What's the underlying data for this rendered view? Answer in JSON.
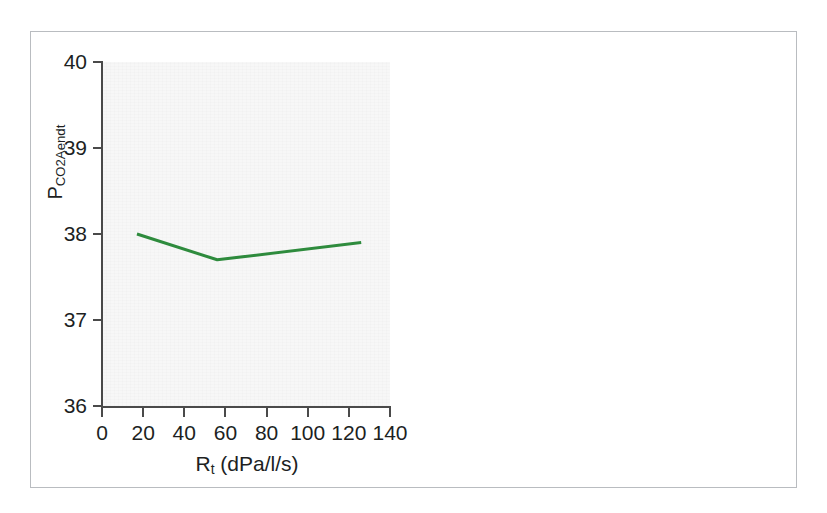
{
  "figure": {
    "frame_border_color": "#b9bcc0",
    "page_background": "#ffffff"
  },
  "chart_data": {
    "type": "line",
    "title": "",
    "subtitle": "",
    "xlabel_text": "R",
    "xlabel_sub": "t",
    "xlabel_unit": " (dPa/l/s)",
    "xlabel": "R_t (dPa/l/s)",
    "ylabel_text": "P",
    "ylabel_sub": "CO2Aendt",
    "ylabel": "P_CO2Aendt",
    "x": [
      17,
      56,
      126
    ],
    "values": [
      38.0,
      37.7,
      37.9
    ],
    "series": [
      {
        "name": "PCO2Aendt vs Rt",
        "color": "#2e8b3d",
        "points": [
          {
            "x": 17,
            "y": 38.0
          },
          {
            "x": 56,
            "y": 37.7
          },
          {
            "x": 126,
            "y": 37.9
          }
        ]
      }
    ],
    "xlim": [
      0,
      140
    ],
    "ylim": [
      36,
      40
    ],
    "xticks": [
      0,
      20,
      40,
      60,
      80,
      100,
      120,
      140
    ],
    "yticks": [
      36,
      37,
      38,
      39,
      40
    ],
    "xtick_labels": [
      "0",
      "20",
      "40",
      "60",
      "80",
      "100",
      "120",
      "140"
    ],
    "ytick_labels": [
      "36",
      "37",
      "38",
      "39",
      "40"
    ],
    "grid": false,
    "legend": false,
    "legend_position": "none",
    "plot_background": "#f7f7f7",
    "axis_color": "#4a4a4a",
    "line_color": "#2e8b3d",
    "line_width": 3,
    "annotations": []
  }
}
